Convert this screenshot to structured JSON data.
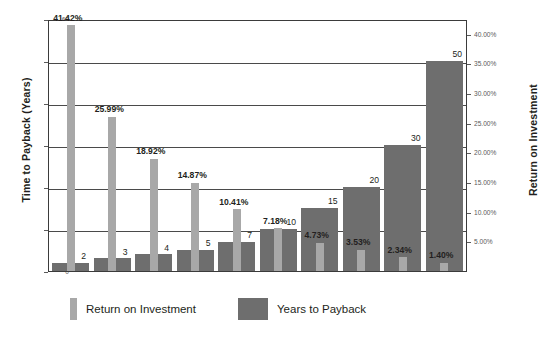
{
  "chart_data": {
    "type": "bar",
    "title": "",
    "subtitle": "",
    "categories": [
      "1",
      "2",
      "3",
      "4",
      "5",
      "6",
      "7",
      "8",
      "9",
      "10"
    ],
    "series": [
      {
        "name": "Return on Investment",
        "axis": "right",
        "color": "#a8a8a8",
        "values": [
          41.42,
          25.99,
          18.92,
          14.87,
          10.41,
          7.18,
          4.73,
          3.53,
          2.34,
          1.4
        ],
        "labels": [
          "41.42%",
          "25.99%",
          "18.92%",
          "14.87%",
          "10.41%",
          "7.18%",
          "4.73%",
          "3.53%",
          "2.34%",
          "1.40%"
        ]
      },
      {
        "name": "Years to Payback",
        "axis": "left",
        "color": "#6e6e6e",
        "values": [
          2,
          3,
          4,
          5,
          7,
          10,
          15,
          20,
          30,
          50
        ],
        "labels": [
          "2",
          "3",
          "4",
          "5",
          "7",
          "10",
          "15",
          "20",
          "30",
          "50"
        ]
      }
    ],
    "xlabel": "",
    "ylabel": "Time to Payback (Years)",
    "y2label": "Return on Investment",
    "ylim": [
      0,
      60
    ],
    "y2lim": [
      0,
      42.5
    ],
    "yticks": [
      0,
      10,
      20,
      30,
      40,
      50,
      60
    ],
    "ytick_labels": [
      "0",
      "10",
      "20",
      "30",
      "40",
      "50",
      "60"
    ],
    "y2ticks": [
      5,
      10,
      15,
      20,
      25,
      30,
      35,
      40
    ],
    "y2tick_labels": [
      "5.00%",
      "10.00%",
      "15.00%",
      "20.00%",
      "25.00%",
      "30.00%",
      "35.00%",
      "40.00%"
    ],
    "gridlines": [
      10,
      20,
      30,
      40,
      50
    ],
    "grid": true,
    "legend_position": "bottom"
  },
  "axes": {
    "left_title": "Time to Payback (Years)",
    "right_title": "Return on Investment"
  },
  "legend": {
    "items": [
      {
        "label": "Return on Investment",
        "swatch": "roi-swatch"
      },
      {
        "label": "Years to Payback",
        "swatch": "years-swatch"
      }
    ]
  }
}
